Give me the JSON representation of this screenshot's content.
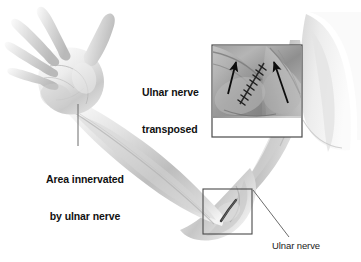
{
  "figure": {
    "background_color": "#ffffff",
    "width": 361,
    "height": 262
  },
  "labels": {
    "transposed_line1": "Ulnar nerve",
    "transposed_line2": "transposed",
    "innervated_line1": "Area innervated",
    "innervated_line2": "by ulnar nerve",
    "ulnar_nerve": "Ulnar nerve"
  },
  "colors": {
    "text": "#111111",
    "text_secondary": "#1b1b1b",
    "leader_line": "#6d6d6d",
    "box_border": "#4a4a4a",
    "arrow": "#0d0d0d",
    "suture": "#262626",
    "skin_light": "#f2f2f2",
    "skin_mid": "#c9c9c9",
    "skin_shadow": "#9a9a9a",
    "inset_fill": "#a8a8a8"
  },
  "inset": {
    "name": "ulnar-nerve-transposed-inset",
    "x": 212,
    "y": 45,
    "width": 90,
    "height": 92,
    "arrow_count": 2,
    "has_suture_line": true
  },
  "callout_box": {
    "name": "elbow-detail-box",
    "x": 203,
    "y": 189,
    "width": 49,
    "height": 45
  },
  "leader_lines": [
    {
      "name": "hand-leader",
      "x1": 78,
      "y1": 104,
      "x2": 78,
      "y2": 146
    },
    {
      "name": "ulnar-nerve-leader",
      "x1": 253,
      "y1": 190,
      "x2": 289,
      "y2": 237
    }
  ]
}
